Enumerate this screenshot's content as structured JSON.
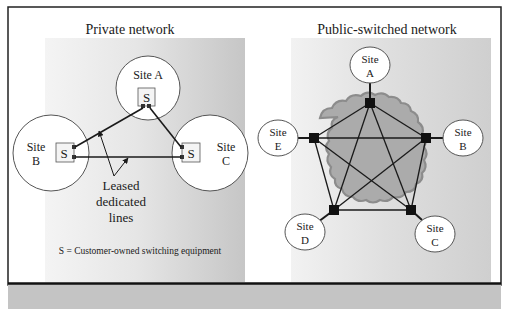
{
  "figure": {
    "left_panel": {
      "title": "Private network",
      "sites": [
        {
          "id": "A",
          "line1": "Site A",
          "line2": ""
        },
        {
          "id": "B",
          "line1": "Site",
          "line2": "B"
        },
        {
          "id": "C",
          "line1": "Site",
          "line2": "C"
        }
      ],
      "switch_label": "S",
      "callout": [
        "Leased",
        "dedicated",
        "lines"
      ],
      "legend": "S = Customer-owned switching equipment"
    },
    "right_panel": {
      "title": "Public-switched network",
      "sites": [
        {
          "id": "A",
          "line1": "Site",
          "line2": "A"
        },
        {
          "id": "B",
          "line1": "Site",
          "line2": "B"
        },
        {
          "id": "C",
          "line1": "Site",
          "line2": "C"
        },
        {
          "id": "D",
          "line1": "Site",
          "line2": "D"
        },
        {
          "id": "E",
          "line1": "Site",
          "line2": "E"
        }
      ]
    },
    "colors": {
      "panel_gradient_light": "#f2f2f2",
      "panel_gradient_dark": "#c9c9c9",
      "cloud_fill": "#a9a9a9",
      "cloud_stroke": "#8e8e8e",
      "line": "#1a1a1a",
      "frame": "#222222",
      "footer_band": "#c4c4c4"
    }
  }
}
